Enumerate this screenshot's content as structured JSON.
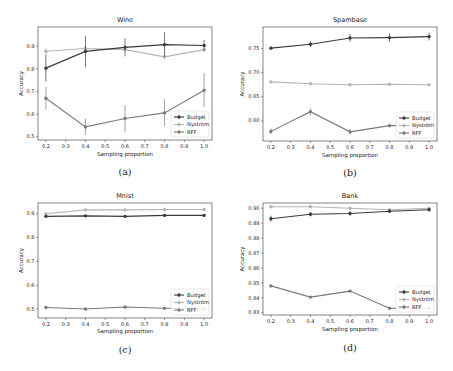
{
  "figure": {
    "panels": [
      {
        "id": "a",
        "caption": "(a)",
        "title": "Wine"
      },
      {
        "id": "b",
        "caption": "(b)",
        "title": "Spambase"
      },
      {
        "id": "c",
        "caption": "(c)",
        "title": "Mnist"
      },
      {
        "id": "d",
        "caption": "(d)",
        "title": "Bank"
      }
    ]
  },
  "colors": {
    "Budget": "#3a3a3a",
    "Nyström": "#b4b4b4",
    "RFF": "#7a7a7a",
    "axes": "#333333",
    "background": "#ffffff"
  },
  "chart_data": [
    {
      "type": "line",
      "title": "Wine",
      "caption": "(a)",
      "xlabel": "Sampling proportion",
      "ylabel": "Accuracy",
      "x": [
        0.2,
        0.4,
        0.6,
        0.8,
        1.0
      ],
      "xticks": [
        0.2,
        0.3,
        0.4,
        0.5,
        0.6,
        0.7,
        0.8,
        0.9,
        1.0
      ],
      "xtick_labels": [
        "0.2",
        "0.3",
        "0.4",
        "0.5",
        "0.6",
        "0.7",
        "0.8",
        "0.9",
        "1.0"
      ],
      "yticks": [
        0.5,
        0.6,
        0.7,
        0.8,
        0.9
      ],
      "ytick_labels": [
        "0.5",
        "0.6",
        "0.7",
        "0.8",
        "0.9"
      ],
      "xlim": [
        0.16,
        1.04
      ],
      "ylim": [
        0.485,
        0.985
      ],
      "grid": false,
      "legend": {
        "position": "lower right",
        "entries": [
          "Budget",
          "Nyström",
          "RFF"
        ]
      },
      "series": [
        {
          "name": "Budget",
          "values": [
            0.803,
            0.877,
            0.895,
            0.907,
            0.903
          ],
          "err": [
            0.06,
            0.07,
            0.04,
            0.055,
            0.025
          ]
        },
        {
          "name": "Nyström",
          "values": [
            0.878,
            0.89,
            0.885,
            0.853,
            0.885
          ],
          "err": [
            0.015,
            0.01,
            0.01,
            0.01,
            0.01
          ]
        },
        {
          "name": "RFF",
          "values": [
            0.67,
            0.543,
            0.58,
            0.605,
            0.705
          ],
          "err": [
            0.05,
            0.035,
            0.06,
            0.06,
            0.075
          ]
        }
      ]
    },
    {
      "type": "line",
      "title": "Spambase",
      "caption": "(b)",
      "xlabel": "Sampling proportion",
      "ylabel": "Accuracy",
      "x": [
        0.2,
        0.4,
        0.6,
        0.8,
        1.0
      ],
      "xticks": [
        0.2,
        0.3,
        0.4,
        0.5,
        0.6,
        0.7,
        0.8,
        0.9,
        1.0
      ],
      "xtick_labels": [
        "0.2",
        "0.3",
        "0.4",
        "0.5",
        "0.6",
        "0.7",
        "0.8",
        "0.9",
        "1.0"
      ],
      "yticks": [
        0.6,
        0.65,
        0.7,
        0.75
      ],
      "ytick_labels": [
        "0.60",
        "0.65",
        "0.70",
        "0.75"
      ],
      "xlim": [
        0.16,
        1.04
      ],
      "ylim": [
        0.558,
        0.795
      ],
      "grid": false,
      "legend": {
        "position": "lower right",
        "entries": [
          "Budget",
          "Nyström",
          "RFF"
        ]
      },
      "series": [
        {
          "name": "Budget",
          "values": [
            0.751,
            0.759,
            0.772,
            0.773,
            0.775
          ],
          "err": [
            0.004,
            0.006,
            0.008,
            0.009,
            0.008
          ]
        },
        {
          "name": "Nyström",
          "values": [
            0.681,
            0.677,
            0.675,
            0.676,
            0.675
          ],
          "err": [
            0.002,
            0.002,
            0.002,
            0.002,
            0.002
          ]
        },
        {
          "name": "RFF",
          "values": [
            0.578,
            0.619,
            0.577,
            0.59,
            0.591
          ],
          "err": [
            0.006,
            0.007,
            0.006,
            0.004,
            0.004
          ]
        }
      ]
    },
    {
      "type": "line",
      "title": "Mnist",
      "caption": "(c)",
      "xlabel": "Sampling proportion",
      "ylabel": "Accuracy",
      "x": [
        0.2,
        0.4,
        0.6,
        0.8,
        1.0
      ],
      "xticks": [
        0.2,
        0.3,
        0.4,
        0.5,
        0.6,
        0.7,
        0.8,
        0.9,
        1.0
      ],
      "xtick_labels": [
        "0.2",
        "0.3",
        "0.4",
        "0.5",
        "0.6",
        "0.7",
        "0.8",
        "0.9",
        "1.0"
      ],
      "yticks": [
        0.5,
        0.6,
        0.7,
        0.8,
        0.9
      ],
      "ytick_labels": [
        "0.5",
        "0.6",
        "0.7",
        "0.8",
        "0.9"
      ],
      "xlim": [
        0.16,
        1.04
      ],
      "ylim": [
        0.462,
        0.945
      ],
      "grid": false,
      "legend": {
        "position": "lower right",
        "entries": [
          "Budget",
          "Nyström",
          "RFF"
        ]
      },
      "series": [
        {
          "name": "Budget",
          "values": [
            0.889,
            0.891,
            0.889,
            0.893,
            0.893
          ],
          "err": [
            0.006,
            0.004,
            0.004,
            0.003,
            0.003
          ]
        },
        {
          "name": "Nyström",
          "values": [
            0.9,
            0.916,
            0.916,
            0.918,
            0.918
          ],
          "err": [
            0.002,
            0.002,
            0.002,
            0.002,
            0.002
          ]
        },
        {
          "name": "RFF",
          "values": [
            0.506,
            0.5,
            0.508,
            0.503,
            0.5
          ],
          "err": [
            0.003,
            0.003,
            0.003,
            0.003,
            0.003
          ]
        }
      ]
    },
    {
      "type": "line",
      "title": "Bank",
      "caption": "(d)",
      "xlabel": "Sampling proportion",
      "ylabel": "Accuracy",
      "x": [
        0.2,
        0.4,
        0.6,
        0.8,
        1.0
      ],
      "xticks": [
        0.2,
        0.3,
        0.4,
        0.5,
        0.6,
        0.7,
        0.8,
        0.9,
        1.0
      ],
      "xtick_labels": [
        "0.2",
        "0.3",
        "0.4",
        "0.5",
        "0.6",
        "0.7",
        "0.8",
        "0.9",
        "1.0"
      ],
      "yticks": [
        0.83,
        0.84,
        0.85,
        0.86,
        0.87,
        0.88,
        0.89,
        0.9
      ],
      "ytick_labels": [
        "0.83",
        "0.84",
        "0.85",
        "0.86",
        "0.87",
        "0.88",
        "0.89",
        "0.90"
      ],
      "xlim": [
        0.16,
        1.04
      ],
      "ylim": [
        0.8285,
        0.9035
      ],
      "grid": false,
      "legend": {
        "position": "lower right",
        "entries": [
          "Budget",
          "Nyström",
          "RFF"
        ]
      },
      "series": [
        {
          "name": "Budget",
          "values": [
            0.893,
            0.896,
            0.8965,
            0.898,
            0.899
          ],
          "err": [
            0.002,
            0.0015,
            0.0015,
            0.001,
            0.001
          ]
        },
        {
          "name": "Nyström",
          "values": [
            0.901,
            0.901,
            0.9,
            0.899,
            0.9
          ],
          "err": [
            0.0005,
            0.0005,
            0.0005,
            0.0005,
            0.0005
          ]
        },
        {
          "name": "RFF",
          "values": [
            0.848,
            0.8405,
            0.8445,
            0.833,
            0.833
          ],
          "err": [
            0.0003,
            0.0003,
            0.0003,
            0.0003,
            0.0003
          ]
        }
      ]
    }
  ]
}
